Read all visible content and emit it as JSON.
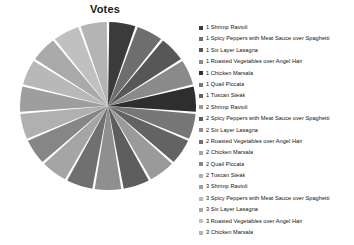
{
  "chart_data": {
    "type": "pie",
    "title": "Votes",
    "xlabel": "",
    "ylabel": "",
    "legend_position": "right",
    "grid": false,
    "start_angle_deg": 90,
    "direction": "clockwise",
    "categories": [
      "1 Shrimp Ravioli",
      "1 Spicy Peppers with Meat Sauce over Spaghetti",
      "1 Six Layer Lasagna",
      "1 Roasted Vegetables over Angel Hair",
      "1 Chicken Marsala",
      "1 Quail Piccata",
      "1 Tuscan Steak",
      "2 Shrimp Ravioli",
      "2 Spicy Peppers with Meat Sauce over Spaghetti",
      "2 Six Layer Lasagna",
      "2 Roasted Vegetables over Angel Hair",
      "2 Chicken Marsala",
      "2 Quail Piccata",
      "2 Tuscan Steak",
      "3 Shrimp Ravioli",
      "3 Spicy Peppers with Meat Sauce over Spaghetti",
      "3 Six Layer Lasagna",
      "3 Roasted Vegetables over Angel Hair",
      "3 Chicken Marsala"
    ],
    "values": [
      1,
      1,
      1,
      1,
      1,
      1,
      1,
      1,
      1,
      1,
      1,
      1,
      1,
      1,
      1,
      1,
      1,
      1,
      1
    ],
    "percent": [
      5.3,
      5.3,
      5.3,
      5.3,
      5.3,
      5.3,
      5.3,
      5.3,
      5.3,
      5.3,
      5.3,
      5.3,
      5.3,
      5.3,
      5.3,
      5.3,
      5.3,
      5.3,
      5.3
    ],
    "colors": [
      "#3b3b3b",
      "#6e6e6e",
      "#575757",
      "#8a8a8a",
      "#2e2e2e",
      "#777777",
      "#636363",
      "#9a9a9a",
      "#5e5e5e",
      "#8f8f8f",
      "#707070",
      "#a5a5a5",
      "#868686",
      "#b0b0b0",
      "#9e9e9e",
      "#b8b8b8",
      "#aaaaaa",
      "#c0c0c0",
      "#b4b4b4"
    ],
    "slice_gap_color": "#ffffff"
  },
  "legend": {
    "items": [
      {
        "label": "1 Shrimp Ravioli",
        "color": "#3b3b3b"
      },
      {
        "label": "1 Spicy Peppers with Meat Sauce over Spaghetti",
        "color": "#6e6e6e"
      },
      {
        "label": "1 Six Layer Lasagna",
        "color": "#575757"
      },
      {
        "label": "1 Roasted Vegetables over Angel Hair",
        "color": "#8a8a8a"
      },
      {
        "label": "1 Chicken Marsala",
        "color": "#2e2e2e"
      },
      {
        "label": "1 Quail Piccata",
        "color": "#777777"
      },
      {
        "label": "1 Tuscan Steak",
        "color": "#636363"
      },
      {
        "label": "2 Shrimp Ravioli",
        "color": "#9a9a9a"
      },
      {
        "label": "2 Spicy Peppers with Meat Sauce over Spaghetti",
        "color": "#5e5e5e"
      },
      {
        "label": "2 Six Layer Lasagna",
        "color": "#8f8f8f"
      },
      {
        "label": "2 Roasted Vegetables over Angel Hair",
        "color": "#707070"
      },
      {
        "label": "2 Chicken Marsala",
        "color": "#a5a5a5"
      },
      {
        "label": "2 Quail Piccata",
        "color": "#868686"
      },
      {
        "label": "2 Tuscan Steak",
        "color": "#b0b0b0"
      },
      {
        "label": "3 Shrimp Ravioli",
        "color": "#9e9e9e"
      },
      {
        "label": "3 Spicy Peppers with Meat Sauce over Spaghetti",
        "color": "#b8b8b8"
      },
      {
        "label": "3 Six Layer Lasagna",
        "color": "#aaaaaa"
      },
      {
        "label": "3 Roasted Vegetables over Angel Hair",
        "color": "#c0c0c0"
      },
      {
        "label": "3 Chicken Marsala",
        "color": "#b4b4b4"
      }
    ]
  }
}
